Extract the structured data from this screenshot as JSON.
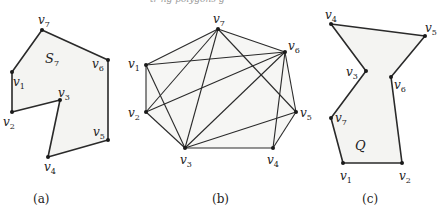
{
  "header_fragment": "tr ng polygons g",
  "panels": [
    {
      "id": "a",
      "caption": "(a)",
      "region_label": "S",
      "region_sub": "7",
      "vertices": [
        {
          "name": "v",
          "sub": "1",
          "x": 12,
          "y": 72
        },
        {
          "name": "v",
          "sub": "2",
          "x": 12,
          "y": 112
        },
        {
          "name": "v",
          "sub": "3",
          "x": 60,
          "y": 100
        },
        {
          "name": "v",
          "sub": "4",
          "x": 48,
          "y": 157
        },
        {
          "name": "v",
          "sub": "5",
          "x": 108,
          "y": 140
        },
        {
          "name": "v",
          "sub": "6",
          "x": 108,
          "y": 60
        },
        {
          "name": "v",
          "sub": "7",
          "x": 42,
          "y": 30
        }
      ]
    },
    {
      "id": "b",
      "caption": "(b)",
      "vertices": [
        {
          "name": "v",
          "sub": "1",
          "x": 146,
          "y": 65
        },
        {
          "name": "v",
          "sub": "2",
          "x": 146,
          "y": 112
        },
        {
          "name": "v",
          "sub": "3",
          "x": 185,
          "y": 148
        },
        {
          "name": "v",
          "sub": "4",
          "x": 273,
          "y": 148
        },
        {
          "name": "v",
          "sub": "5",
          "x": 296,
          "y": 112
        },
        {
          "name": "v",
          "sub": "6",
          "x": 285,
          "y": 52
        },
        {
          "name": "v",
          "sub": "7",
          "x": 218,
          "y": 29
        }
      ],
      "edges": [
        [
          "v1",
          "v2"
        ],
        [
          "v2",
          "v3"
        ],
        [
          "v3",
          "v4"
        ],
        [
          "v4",
          "v5"
        ],
        [
          "v5",
          "v6"
        ],
        [
          "v6",
          "v7"
        ],
        [
          "v7",
          "v1"
        ],
        [
          "v1",
          "v3"
        ],
        [
          "v1",
          "v6"
        ],
        [
          "v2",
          "v7"
        ],
        [
          "v2",
          "v6"
        ],
        [
          "v3",
          "v7"
        ],
        [
          "v3",
          "v6"
        ],
        [
          "v3",
          "v5"
        ],
        [
          "v7",
          "v5"
        ],
        [
          "v6",
          "v4"
        ]
      ]
    },
    {
      "id": "c",
      "caption": "(c)",
      "region_label": "Q",
      "vertices": [
        {
          "name": "v",
          "sub": "1",
          "x": 343,
          "y": 163
        },
        {
          "name": "v",
          "sub": "2",
          "x": 402,
          "y": 163
        },
        {
          "name": "v",
          "sub": "3",
          "x": 366,
          "y": 71
        },
        {
          "name": "v",
          "sub": "4",
          "x": 331,
          "y": 24
        },
        {
          "name": "v",
          "sub": "5",
          "x": 425,
          "y": 36
        },
        {
          "name": "v",
          "sub": "6",
          "x": 391,
          "y": 77
        },
        {
          "name": "v",
          "sub": "7",
          "x": 331,
          "y": 118
        }
      ],
      "boundary_order": [
        "v1",
        "v2",
        "v6",
        "v5",
        "v4",
        "v3",
        "v7"
      ]
    }
  ]
}
